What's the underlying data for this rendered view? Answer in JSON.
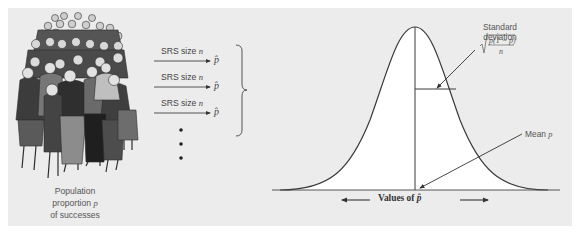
{
  "diagram": {
    "population": {
      "caption_lines": [
        "Population",
        "proportion",
        "of successes"
      ],
      "symbol": "p"
    },
    "samples": [
      {
        "label": "SRS size",
        "n_symbol": "n",
        "result": "p̂"
      },
      {
        "label": "SRS size",
        "n_symbol": "n",
        "result": "p̂"
      },
      {
        "label": "SRS size",
        "n_symbol": "n",
        "result": "p̂"
      }
    ],
    "continuation": "⋮",
    "curve": {
      "type": "normal",
      "std_dev_label_lines": [
        "Standard",
        "deviation"
      ],
      "std_dev_formula": {
        "numerator": "p(1 − p)",
        "denominator": "n"
      },
      "mean_label": "Mean",
      "mean_symbol": "p",
      "x_axis_label": "Values of",
      "x_axis_symbol": "p̂"
    },
    "colors": {
      "panel_bg": "#ececec",
      "curve_fill": "#ffffff",
      "stroke": "#3a3a3a",
      "text": "#555555"
    }
  }
}
